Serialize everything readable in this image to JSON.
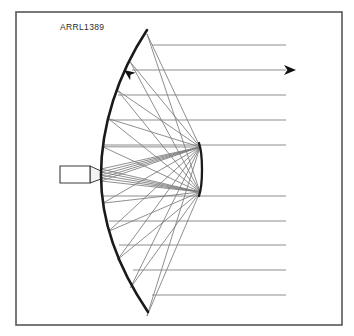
{
  "figure": {
    "label": "ARRL1389",
    "label_x": 60,
    "label_y": 22,
    "width": 354,
    "height": 336,
    "background_color": "#ffffff"
  },
  "frame": {
    "x": 16,
    "y": 12,
    "width": 326,
    "height": 313,
    "stroke_color": "#575757",
    "stroke_width": 1.6
  },
  "colors": {
    "reflector": "#1a1a1a",
    "ray": "#8d8d8d",
    "converging_ray": "#7b7b7b",
    "horn_outline": "#3a3a3a",
    "arrow": "#111111",
    "frame": "#575757"
  },
  "reflector": {
    "name": "parabolic-reflector",
    "vertex_x": 101,
    "vertex_y": 175,
    "top_tip_x": 147,
    "top_tip_y": 30,
    "bottom_tip_x": 148,
    "bottom_tip_y": 312,
    "path": "M 147 30 C 118 74, 101 126, 101 175 C 101 224, 119 269, 148 312",
    "stroke_width": 2.6
  },
  "focal_arc": {
    "name": "focal-plane-arc",
    "x": 200,
    "y_top": 143,
    "y_bottom": 196,
    "path": "M 199 143 C 203 155, 203 184, 199 196",
    "stroke_width": 2.3
  },
  "feed_horn": {
    "name": "feed-horn",
    "rect_x": 60,
    "rect_y": 166,
    "rect_width": 30,
    "rect_height": 17,
    "flare_path": "M 90 166 L 101 171 L 101 179 L 90 183 Z",
    "body_path": "M 60 166 L 90 166 L 90 183 L 60 183 Z"
  },
  "parallel_rays": {
    "name": "parallel-wavefront-rays",
    "x_end": 286,
    "y_values": [
      45,
      70,
      95,
      120,
      145,
      196,
      221,
      245,
      270,
      295
    ],
    "x_starts": [
      152,
      132,
      118,
      109,
      103,
      103,
      109,
      119,
      133,
      152
    ],
    "count": 10,
    "stroke_width": 1.0
  },
  "converging_rays": {
    "name": "converging-focal-rays",
    "focus_top_x": 200,
    "focus_top_y": 147,
    "focus_bottom_x": 200,
    "focus_bottom_y": 192,
    "count": 20
  },
  "arrows": [
    {
      "name": "reflected-ray-arrow",
      "tip_x": 124,
      "tip_y": 70,
      "angle_deg": 216,
      "size": 11,
      "direction": "up-left"
    },
    {
      "name": "outgoing-beam-arrow",
      "tip_x": 296,
      "tip_y": 70,
      "angle_deg": 0,
      "size": 12,
      "direction": "right"
    }
  ],
  "chart_data": {
    "type": "diagram",
    "title": "ARRL1389",
    "elements": [
      "parabolic reflector dish",
      "feed horn at vertex",
      "focal arc",
      "parallel outgoing rays",
      "converging rays to focus",
      "direction arrows"
    ]
  }
}
